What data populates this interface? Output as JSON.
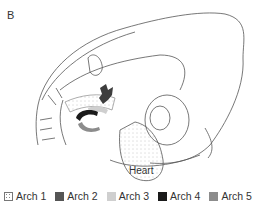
{
  "figure": {
    "panel_label": "B",
    "structure_label": "Heart"
  },
  "legend": {
    "items": [
      {
        "label": "Arch 1",
        "color": "#ffffff",
        "pattern": "dotted"
      },
      {
        "label": "Arch 2",
        "color": "#555555",
        "pattern": "solid"
      },
      {
        "label": "Arch 3",
        "color": "#cfcfcf",
        "pattern": "solid"
      },
      {
        "label": "Arch 4",
        "color": "#1a1a1a",
        "pattern": "solid"
      },
      {
        "label": "Arch 5",
        "color": "#8c8c8c",
        "pattern": "solid"
      }
    ]
  }
}
